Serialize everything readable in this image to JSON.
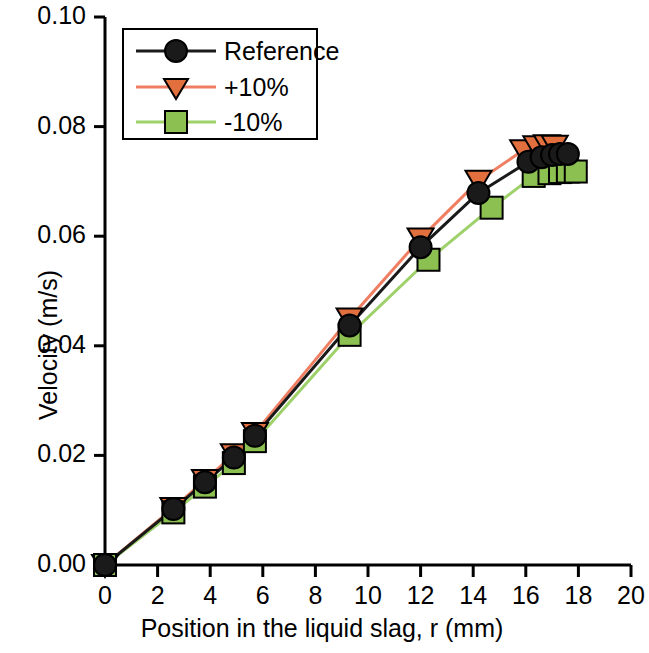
{
  "chart_data": {
    "type": "line",
    "title": "",
    "xlabel": "Position in the liquid slag, r (mm)",
    "ylabel": "Velocity (m/s)",
    "xlim": [
      0,
      20
    ],
    "ylim": [
      0.0,
      0.1
    ],
    "xticks": [
      "0",
      "2",
      "4",
      "6",
      "8",
      "10",
      "12",
      "14",
      "16",
      "18",
      "20"
    ],
    "xtick_values": [
      0,
      2,
      4,
      6,
      8,
      10,
      12,
      14,
      16,
      18,
      20
    ],
    "yticks": [
      "0.00",
      "0.02",
      "0.04",
      "0.06",
      "0.08",
      "0.10"
    ],
    "ytick_values": [
      0.0,
      0.02,
      0.04,
      0.06,
      0.08,
      0.1
    ],
    "grid": false,
    "legend_position": "upper left",
    "series": [
      {
        "name": "Reference",
        "color": "#1a1a1a",
        "marker": "circle",
        "marker_facecolor": "#1a1a1a",
        "x": [
          0.0,
          2.6,
          3.8,
          4.9,
          5.7,
          9.3,
          12.0,
          14.2,
          16.1,
          16.6,
          17.0,
          17.3,
          17.6
        ],
        "y": [
          0.0,
          0.0102,
          0.0151,
          0.0196,
          0.0236,
          0.0437,
          0.058,
          0.0679,
          0.0736,
          0.0744,
          0.0748,
          0.075,
          0.075
        ]
      },
      {
        "name": "+10%",
        "color": "#ef7e62",
        "marker": "triangle-down",
        "marker_facecolor": "#e2703f",
        "x": [
          0.0,
          2.6,
          3.8,
          4.9,
          5.7,
          9.3,
          12.0,
          14.2,
          15.9,
          16.4,
          16.8,
          17.1
        ],
        "y": [
          0.0,
          0.0104,
          0.0155,
          0.0202,
          0.0241,
          0.045,
          0.0596,
          0.0701,
          0.0757,
          0.0764,
          0.0766,
          0.0765
        ]
      },
      {
        "name": "-10%",
        "color": "#9ed16a",
        "marker": "square",
        "marker_facecolor": "#8cc152",
        "x": [
          0.0,
          2.6,
          3.8,
          4.9,
          5.7,
          9.3,
          12.3,
          14.7,
          16.3,
          16.9,
          17.3,
          17.6,
          17.9
        ],
        "y": [
          0.0,
          0.0096,
          0.0143,
          0.0186,
          0.0226,
          0.042,
          0.0557,
          0.0652,
          0.071,
          0.0715,
          0.0717,
          0.0718,
          0.0718
        ]
      }
    ]
  },
  "legend": {
    "entries": [
      {
        "label": "Reference"
      },
      {
        "label": "+10%"
      },
      {
        "label": "-10%"
      }
    ]
  }
}
